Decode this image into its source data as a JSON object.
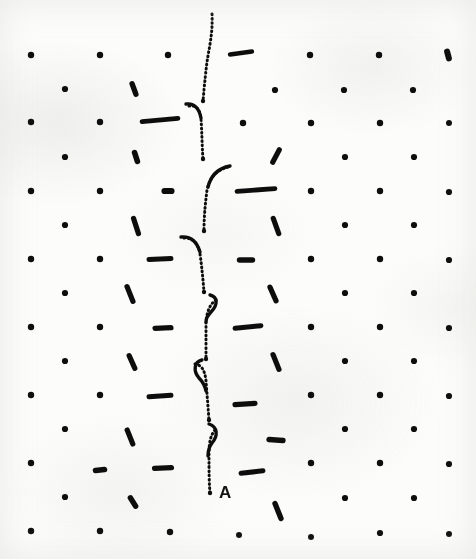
{
  "figure": {
    "kind": "crystal-lattice-dislocation-micrograph",
    "width": 476,
    "height": 559,
    "background_color": "#fcfcfb",
    "ink_color": "#111111",
    "caption_text": "",
    "annotations": [
      {
        "name": "dislocation-label-A",
        "text": "A",
        "x": 211,
        "y": 493
      }
    ]
  },
  "chart_data": {
    "type": "scatter",
    "title": "",
    "subtitle": "",
    "xlabel": "",
    "ylabel": "",
    "xlim": [
      0,
      476
    ],
    "ylim": [
      0,
      559
    ],
    "grid": false,
    "legend": null,
    "lattice": {
      "note": "Centred rectangular lattice: primary rows at row_y, offset rows shifted by half a period in both x and y.",
      "x_spacing": 68.5,
      "y_spacing": 68.0,
      "x_origin": 31,
      "y_origin": 55,
      "offset_x": 34.3,
      "offset_y": 34.0,
      "dot_radius": 3.1
    },
    "atoms": [
      {
        "x": 31,
        "y": 55,
        "len": 0,
        "angle": 0,
        "w": 6.4
      },
      {
        "x": 100,
        "y": 55,
        "len": 0,
        "angle": 0,
        "w": 6.4
      },
      {
        "x": 168,
        "y": 55,
        "len": 0,
        "angle": 0,
        "w": 6.4
      },
      {
        "x": 310,
        "y": 55,
        "len": 0,
        "angle": 0,
        "w": 6.4
      },
      {
        "x": 379,
        "y": 55,
        "len": 0,
        "angle": 0,
        "w": 6.4
      },
      {
        "x": 448,
        "y": 55,
        "len": 7,
        "angle": 75,
        "w": 6.0
      },
      {
        "x": 241,
        "y": 53,
        "len": 22,
        "angle": -8,
        "w": 4.6
      },
      {
        "x": 65,
        "y": 89,
        "len": 0,
        "angle": 0,
        "w": 6.2
      },
      {
        "x": 134,
        "y": 89,
        "len": 11,
        "angle": 70,
        "w": 5.4
      },
      {
        "x": 275,
        "y": 90,
        "len": 0,
        "angle": 0,
        "w": 6.2
      },
      {
        "x": 344,
        "y": 90,
        "len": 0,
        "angle": 0,
        "w": 6.2
      },
      {
        "x": 413,
        "y": 90,
        "len": 0,
        "angle": 0,
        "w": 6.2
      },
      {
        "x": 31,
        "y": 122,
        "len": 0,
        "angle": 0,
        "w": 6.4
      },
      {
        "x": 100,
        "y": 122,
        "len": 0,
        "angle": 0,
        "w": 6.4
      },
      {
        "x": 160,
        "y": 120,
        "len": 36,
        "angle": -5,
        "w": 4.8
      },
      {
        "x": 243,
        "y": 123,
        "len": 0,
        "angle": 0,
        "w": 6.4
      },
      {
        "x": 311,
        "y": 123,
        "len": 0,
        "angle": 0,
        "w": 6.4
      },
      {
        "x": 380,
        "y": 123,
        "len": 0,
        "angle": 0,
        "w": 6.4
      },
      {
        "x": 449,
        "y": 123,
        "len": 0,
        "angle": 0,
        "w": 6.0
      },
      {
        "x": 65,
        "y": 157,
        "len": 0,
        "angle": 0,
        "w": 6.2
      },
      {
        "x": 136,
        "y": 157,
        "len": 9,
        "angle": 72,
        "w": 5.6
      },
      {
        "x": 276,
        "y": 156,
        "len": 14,
        "angle": -62,
        "w": 5.2
      },
      {
        "x": 345,
        "y": 157,
        "len": 0,
        "angle": 0,
        "w": 6.2
      },
      {
        "x": 414,
        "y": 157,
        "len": 0,
        "angle": 0,
        "w": 6.2
      },
      {
        "x": 31,
        "y": 191,
        "len": 0,
        "angle": 0,
        "w": 6.4
      },
      {
        "x": 100,
        "y": 191,
        "len": 0,
        "angle": 0,
        "w": 6.4
      },
      {
        "x": 168,
        "y": 191,
        "len": 7,
        "angle": 0,
        "w": 6.2
      },
      {
        "x": 256,
        "y": 190,
        "len": 38,
        "angle": -4,
        "w": 4.8
      },
      {
        "x": 311,
        "y": 191,
        "len": 0,
        "angle": 0,
        "w": 6.4
      },
      {
        "x": 380,
        "y": 191,
        "len": 0,
        "angle": 0,
        "w": 6.4
      },
      {
        "x": 449,
        "y": 192,
        "len": 0,
        "angle": 0,
        "w": 6.2
      },
      {
        "x": 65,
        "y": 225,
        "len": 0,
        "angle": 0,
        "w": 6.2
      },
      {
        "x": 136,
        "y": 226,
        "len": 16,
        "angle": 72,
        "w": 5.2
      },
      {
        "x": 276,
        "y": 226,
        "len": 16,
        "angle": 70,
        "w": 5.2
      },
      {
        "x": 345,
        "y": 225,
        "len": 0,
        "angle": 0,
        "w": 6.2
      },
      {
        "x": 414,
        "y": 225,
        "len": 0,
        "angle": 0,
        "w": 6.2
      },
      {
        "x": 31,
        "y": 259,
        "len": 0,
        "angle": 0,
        "w": 6.4
      },
      {
        "x": 100,
        "y": 259,
        "len": 0,
        "angle": 0,
        "w": 6.4
      },
      {
        "x": 160,
        "y": 259,
        "len": 22,
        "angle": -3,
        "w": 5.0
      },
      {
        "x": 246,
        "y": 260,
        "len": 13,
        "angle": 0,
        "w": 5.4
      },
      {
        "x": 311,
        "y": 259,
        "len": 0,
        "angle": 0,
        "w": 6.4
      },
      {
        "x": 380,
        "y": 259,
        "len": 0,
        "angle": 0,
        "w": 6.4
      },
      {
        "x": 449,
        "y": 260,
        "len": 0,
        "angle": 0,
        "w": 6.2
      },
      {
        "x": 65,
        "y": 293,
        "len": 0,
        "angle": 0,
        "w": 6.2
      },
      {
        "x": 130,
        "y": 294,
        "len": 16,
        "angle": 68,
        "w": 5.2
      },
      {
        "x": 273,
        "y": 294,
        "len": 15,
        "angle": 66,
        "w": 5.2
      },
      {
        "x": 345,
        "y": 293,
        "len": 0,
        "angle": 0,
        "w": 6.2
      },
      {
        "x": 414,
        "y": 293,
        "len": 0,
        "angle": 0,
        "w": 6.2
      },
      {
        "x": 31,
        "y": 327,
        "len": 0,
        "angle": 0,
        "w": 6.4
      },
      {
        "x": 100,
        "y": 327,
        "len": 0,
        "angle": 0,
        "w": 6.4
      },
      {
        "x": 163,
        "y": 328,
        "len": 16,
        "angle": -2,
        "w": 5.2
      },
      {
        "x": 248,
        "y": 327,
        "len": 26,
        "angle": -6,
        "w": 5.0
      },
      {
        "x": 311,
        "y": 327,
        "len": 0,
        "angle": 0,
        "w": 6.4
      },
      {
        "x": 380,
        "y": 327,
        "len": 0,
        "angle": 0,
        "w": 6.4
      },
      {
        "x": 449,
        "y": 328,
        "len": 0,
        "angle": 0,
        "w": 6.2
      },
      {
        "x": 65,
        "y": 361,
        "len": 0,
        "angle": 0,
        "w": 6.2
      },
      {
        "x": 132,
        "y": 362,
        "len": 14,
        "angle": 66,
        "w": 5.2
      },
      {
        "x": 276,
        "y": 362,
        "len": 16,
        "angle": 68,
        "w": 5.2
      },
      {
        "x": 345,
        "y": 361,
        "len": 0,
        "angle": 0,
        "w": 6.2
      },
      {
        "x": 414,
        "y": 361,
        "len": 0,
        "angle": 0,
        "w": 6.2
      },
      {
        "x": 31,
        "y": 395,
        "len": 0,
        "angle": 0,
        "w": 6.4
      },
      {
        "x": 100,
        "y": 395,
        "len": 0,
        "angle": 0,
        "w": 6.4
      },
      {
        "x": 160,
        "y": 396,
        "len": 22,
        "angle": -4,
        "w": 5.0
      },
      {
        "x": 245,
        "y": 404,
        "len": 20,
        "angle": -4,
        "w": 5.2
      },
      {
        "x": 311,
        "y": 395,
        "len": 0,
        "angle": 0,
        "w": 6.4
      },
      {
        "x": 380,
        "y": 395,
        "len": 0,
        "angle": 0,
        "w": 6.4
      },
      {
        "x": 449,
        "y": 396,
        "len": 0,
        "angle": 0,
        "w": 6.2
      },
      {
        "x": 65,
        "y": 429,
        "len": 0,
        "angle": 0,
        "w": 6.2
      },
      {
        "x": 130,
        "y": 437,
        "len": 15,
        "angle": 68,
        "w": 5.2
      },
      {
        "x": 276,
        "y": 440,
        "len": 14,
        "angle": 4,
        "w": 5.4
      },
      {
        "x": 345,
        "y": 429,
        "len": 0,
        "angle": 0,
        "w": 6.2
      },
      {
        "x": 414,
        "y": 429,
        "len": 0,
        "angle": 0,
        "w": 6.2
      },
      {
        "x": 31,
        "y": 463,
        "len": 0,
        "angle": 0,
        "w": 6.4
      },
      {
        "x": 100,
        "y": 470,
        "len": 9,
        "angle": -6,
        "w": 5.6
      },
      {
        "x": 163,
        "y": 468,
        "len": 17,
        "angle": -2,
        "w": 5.2
      },
      {
        "x": 252,
        "y": 472,
        "len": 22,
        "angle": -6,
        "w": 5.0
      },
      {
        "x": 311,
        "y": 463,
        "len": 0,
        "angle": 0,
        "w": 6.4
      },
      {
        "x": 380,
        "y": 463,
        "len": 0,
        "angle": 0,
        "w": 6.4
      },
      {
        "x": 449,
        "y": 464,
        "len": 0,
        "angle": 0,
        "w": 6.2
      },
      {
        "x": 65,
        "y": 497,
        "len": 0,
        "angle": 0,
        "w": 6.2
      },
      {
        "x": 133,
        "y": 502,
        "len": 10,
        "angle": 58,
        "w": 5.4
      },
      {
        "x": 278,
        "y": 511,
        "len": 16,
        "angle": 68,
        "w": 5.4
      },
      {
        "x": 345,
        "y": 498,
        "len": 0,
        "angle": 0,
        "w": 6.2
      },
      {
        "x": 414,
        "y": 498,
        "len": 0,
        "angle": 0,
        "w": 6.2
      },
      {
        "x": 31,
        "y": 531,
        "len": 0,
        "angle": 0,
        "w": 6.4
      },
      {
        "x": 100,
        "y": 531,
        "len": 0,
        "angle": 0,
        "w": 6.4
      },
      {
        "x": 170,
        "y": 532,
        "len": 0,
        "angle": 0,
        "w": 6.4
      },
      {
        "x": 239,
        "y": 535,
        "len": 0,
        "angle": 0,
        "w": 6.0
      },
      {
        "x": 311,
        "y": 537,
        "len": 0,
        "angle": 0,
        "w": 6.0
      },
      {
        "x": 380,
        "y": 533,
        "len": 0,
        "angle": 0,
        "w": 6.2
      },
      {
        "x": 449,
        "y": 534,
        "len": 0,
        "angle": 0,
        "w": 6.0
      }
    ],
    "dislocation_line": {
      "name": "dislocation-line-A",
      "style": "dotted",
      "dot_radius": 1.5,
      "dot_spacing": 4.2,
      "segments": [
        {
          "id": "seg-1",
          "path": "M 212 14 C 213 34, 209 48, 207 62 C 205 78, 204 90, 203 101"
        },
        {
          "id": "seg-2",
          "path": "M 189 106 C 197 105, 200 110, 201 119 C 202 133, 202 146, 203 159"
        },
        {
          "id": "seg-3",
          "path": "M 228 167 C 217 170, 210 177, 207 190 C 205 206, 204 218, 204 231"
        },
        {
          "id": "seg-4",
          "path": "M 184 238 C 193 238, 198 243, 200 254 C 202 268, 203 280, 204 292"
        },
        {
          "id": "seg-5",
          "path": "M 216 300 C 210 304, 207 311, 206 322 C 206 335, 206 348, 206 359"
        },
        {
          "id": "seg-6",
          "path": "M 195 364 C 202 365, 205 371, 206 381 C 207 394, 208 407, 209 420"
        },
        {
          "id": "seg-7",
          "path": "M 215 430 C 210 436, 209 444, 209 455 C 209 470, 209 482, 210 493"
        }
      ],
      "hooks": [
        {
          "id": "hook-1",
          "path": "M 186 104 C 194 103, 199 108, 201 118"
        },
        {
          "id": "hook-2",
          "path": "M 230 166 C 219 168, 211 175, 208 187"
        },
        {
          "id": "hook-3",
          "path": "M 181 237 C 191 236, 197 242, 200 252"
        },
        {
          "id": "hook-4",
          "path": "M 210 295 C 218 297, 218 305, 211 312 C 208 315, 206 318, 206 322"
        },
        {
          "id": "hook-5",
          "path": "M 202 360 C 194 362, 193 371, 199 378 C 203 382, 205 386, 206 391"
        },
        {
          "id": "hook-6",
          "path": "M 209 424 C 218 427, 218 436, 212 443 C 209 447, 208 451, 208 456"
        }
      ],
      "terminus": {
        "x": 210,
        "y": 493,
        "label": "A"
      }
    }
  }
}
